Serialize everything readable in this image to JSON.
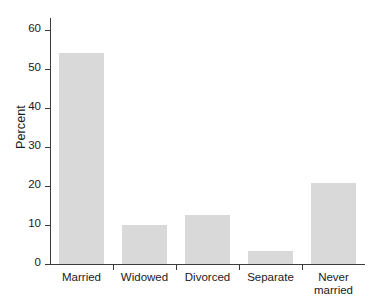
{
  "chart_data": {
    "type": "bar",
    "title": "",
    "subtitle": "",
    "xlabel": "",
    "ylabel": "Percent",
    "categories": [
      "Married",
      "Widowed",
      "Divorced",
      "Separate",
      "Never\nmarried"
    ],
    "values": [
      54.0,
      10.0,
      12.5,
      3.3,
      20.8
    ],
    "ylim": [
      0,
      63
    ],
    "yticks": [
      0,
      10,
      20,
      30,
      40,
      50,
      60
    ],
    "ytick_labels": [
      "0",
      "10",
      "20",
      "30",
      "40",
      "50",
      "60"
    ],
    "grid": false,
    "legend": null,
    "bar_color": "#d9d9d9",
    "axis_color": "#3b3b3b",
    "background": "#ffffff"
  }
}
